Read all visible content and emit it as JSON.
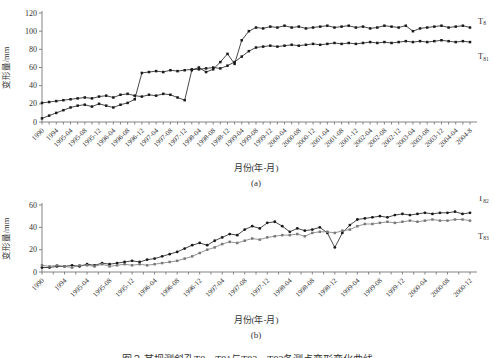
{
  "colors": {
    "axis": "#777777",
    "text": "#333333",
    "series_black": "#1a1a1a",
    "series_gray": "#7a7a7a"
  },
  "caption": {
    "text": "图２ 某坝测斜孔T8、T81与T82、T83各测点变形变化曲线"
  },
  "chart_data": [
    {
      "id": "a",
      "type": "line",
      "title": "",
      "xlabel": "月份(年-月)",
      "ylabel": "变形量/mm",
      "sublabel": "(a)",
      "ylim": [
        0,
        120
      ],
      "yticks": [
        0,
        20,
        40,
        60,
        80,
        100,
        120
      ],
      "grid": false,
      "legend_position": "right-of-line",
      "categories": [
        "1990",
        "1994",
        "1995-04",
        "1995-08",
        "1995-12",
        "1996-04",
        "1996-08",
        "1996-12",
        "1997-04",
        "1997-08",
        "1997-12",
        "1998-04",
        "1998-08",
        "1998-12",
        "1999-04",
        "1999-08",
        "1999-12",
        "2000-04",
        "2000-08",
        "2000-12",
        "2001-04",
        "2001-08",
        "2001-12",
        "2002-04",
        "2002-08",
        "2002-12",
        "2003-04",
        "2003-08",
        "2003-12",
        "2004-04",
        "2004-8"
      ],
      "series": [
        {
          "name": "T8",
          "label_base": "T",
          "label_sub": "8",
          "color": "#1a1a1a",
          "marker": "square",
          "values": [
            21,
            22,
            23,
            24,
            25,
            26,
            27,
            26,
            28,
            29,
            27,
            30,
            31,
            29,
            28,
            30,
            29,
            31,
            30,
            27,
            24,
            57,
            60,
            55,
            58,
            66,
            75,
            64,
            90,
            100,
            104,
            103,
            105,
            104,
            106,
            104,
            105,
            103,
            104,
            105,
            106,
            104,
            105,
            106,
            104,
            105,
            103,
            104,
            106,
            105,
            104,
            106,
            100,
            103,
            104,
            105,
            106,
            104,
            105,
            106,
            104
          ]
        },
        {
          "name": "T81",
          "label_base": "T",
          "label_sub": "81",
          "color": "#1a1a1a",
          "marker": "square",
          "values": [
            4,
            7,
            10,
            13,
            16,
            18,
            19,
            17,
            20,
            18,
            16,
            19,
            21,
            25,
            54,
            55,
            56,
            55,
            57,
            56,
            57,
            58,
            58,
            59,
            60,
            59,
            62,
            66,
            72,
            78,
            82,
            83,
            84,
            83,
            84,
            85,
            84,
            85,
            86,
            85,
            86,
            87,
            86,
            87,
            86,
            87,
            88,
            87,
            88,
            87,
            88,
            89,
            88,
            89,
            88,
            89,
            90,
            89,
            88,
            89,
            88
          ]
        }
      ]
    },
    {
      "id": "b",
      "type": "line",
      "title": "",
      "xlabel": "月份(年-月)",
      "ylabel": "变形量/mm",
      "sublabel": "(b)",
      "ylim": [
        0,
        60
      ],
      "yticks": [
        0,
        20,
        40,
        60
      ],
      "grid": false,
      "legend_position": "right-of-line",
      "categories": [
        "1990",
        "1994",
        "1995-04",
        "1995-08",
        "1995-12",
        "1996-04",
        "1996-08",
        "1996-12",
        "1997-04",
        "1997-08",
        "1997-12",
        "1998-04",
        "1998-08",
        "1998-12",
        "1999-04",
        "1999-08",
        "1999-12",
        "2000-04",
        "2000-08",
        "2000-12"
      ],
      "series": [
        {
          "name": "T82",
          "label_base": "T",
          "label_sub": "82",
          "color": "#1a1a1a",
          "marker": "circle",
          "values": [
            4,
            4,
            5,
            5,
            6,
            5,
            7,
            6,
            8,
            7,
            8,
            9,
            10,
            9,
            11,
            12,
            14,
            16,
            18,
            21,
            24,
            26,
            24,
            28,
            31,
            34,
            33,
            38,
            41,
            39,
            44,
            45,
            41,
            36,
            39,
            37,
            38,
            40,
            35,
            22,
            35,
            42,
            47,
            48,
            49,
            50,
            49,
            51,
            52,
            51,
            52,
            53,
            52,
            53,
            53,
            54,
            52,
            53
          ]
        },
        {
          "name": "T83",
          "label_base": "T",
          "label_sub": "83",
          "color": "#7a7a7a",
          "marker": "square",
          "values": [
            6,
            5,
            6,
            5,
            4,
            6,
            6,
            5,
            7,
            5,
            6,
            7,
            6,
            7,
            6,
            7,
            8,
            9,
            10,
            12,
            14,
            17,
            20,
            22,
            25,
            27,
            26,
            28,
            30,
            29,
            31,
            32,
            33,
            33,
            34,
            32,
            35,
            36,
            36,
            35,
            37,
            38,
            41,
            43,
            43,
            44,
            45,
            44,
            45,
            46,
            45,
            46,
            47,
            46,
            46,
            47,
            47,
            46
          ]
        }
      ]
    }
  ]
}
